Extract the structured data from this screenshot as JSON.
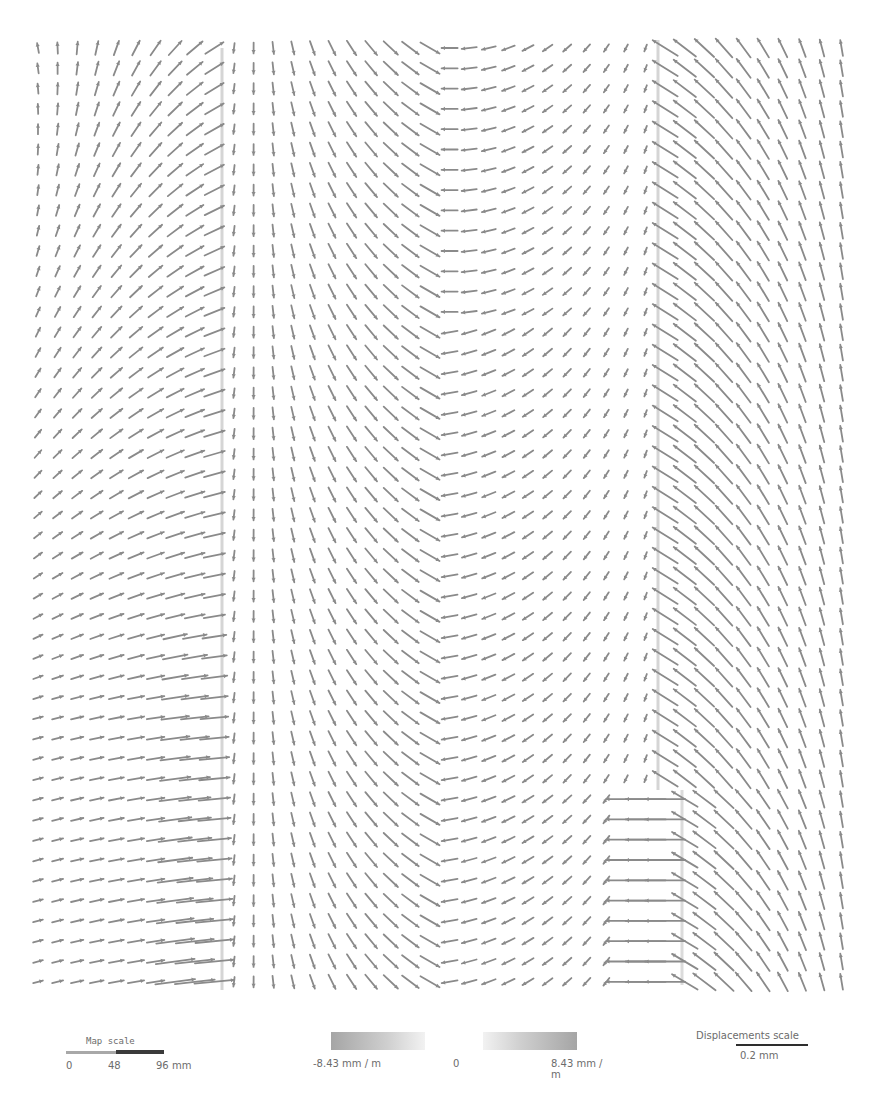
{
  "chart_data": {
    "type": "vector_field",
    "title": "",
    "grid": {
      "x_start": 38,
      "x_step": 19.6,
      "columns": 42,
      "y_start": 48,
      "y_step": 20.3,
      "rows": 47
    },
    "regions": [
      {
        "name": "left-block",
        "x_range": [
          38,
          222
        ],
        "pattern": "arrows rotate from near-vertical at left edge to up-right diagonal near right edge; lower rows become near-horizontal pointing right; strong dense arrows along right boundary at x~222 in rows 29-46"
      },
      {
        "name": "left-center-block",
        "x_range": [
          240,
          430
        ],
        "pattern": "arrows near-vertical pointing down at left, rotating to down-right diagonal approaching center"
      },
      {
        "name": "center-line",
        "x": 432,
        "pattern": "converging X-shaped crossings"
      },
      {
        "name": "right-center-block",
        "x_range": [
          450,
          640
        ],
        "pattern": "arrows pointing left/down-left, short near x~600"
      },
      {
        "name": "right-block",
        "x_range": [
          658,
          840
        ],
        "pattern": "arrows pointing up-left diagonal, steepening to near-vertical at right edge; step discontinuity at row ~37 where boundary shifts from x~658 to x~682 and horizontal left-pointing arrows appear at x~620-660"
      }
    ],
    "colorbar": {
      "min": "-8.43 mm / m",
      "mid": "0",
      "max": "8.43 mm / m"
    },
    "map_scale": {
      "title": "Map scale",
      "ticks": [
        "0",
        "48",
        "96 mm"
      ]
    },
    "displacement_scale": {
      "title": "Displacements scale",
      "value": "0.2 mm"
    },
    "arrow_color": "#8a8a8a",
    "grid_on": false
  },
  "legend": {
    "map_scale": {
      "title": "Map scale",
      "tick0": "0",
      "tick1": "48",
      "tick2": "96 mm"
    },
    "colorbar": {
      "min": "-8.43 mm / m",
      "mid": "0",
      "max": "8.43 mm / m"
    },
    "displacement_scale": {
      "title": "Displacements scale",
      "value": "0.2 mm"
    }
  }
}
